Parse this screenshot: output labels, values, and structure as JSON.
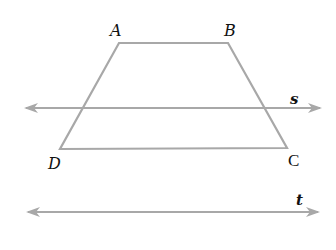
{
  "diagram": {
    "type": "geometry",
    "colors": {
      "stroke": "#a8a8a8",
      "label": "#111111",
      "background": "#ffffff"
    },
    "stroke_width": 2.2,
    "vertices": {
      "A": {
        "label": "A",
        "x": 119,
        "y": 43
      },
      "B": {
        "label": "B",
        "x": 228,
        "y": 43
      },
      "C": {
        "label": "C",
        "x": 287,
        "y": 148
      },
      "D": {
        "label": "D",
        "x": 60,
        "y": 149
      }
    },
    "lines": {
      "s": {
        "label": "s",
        "x1": 22,
        "y1": 108,
        "x2": 324,
        "y2": 108,
        "arrows": "both"
      },
      "t": {
        "label": "t",
        "x1": 24,
        "y1": 212,
        "x2": 322,
        "y2": 212,
        "arrows": "both"
      }
    },
    "labels": {
      "A": "A",
      "B": "B",
      "C": "C",
      "D": "D",
      "s": "s",
      "t": "t"
    }
  }
}
